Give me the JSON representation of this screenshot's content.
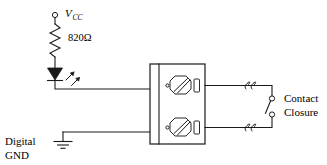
{
  "diagram": {
    "background_color": "#ffffff",
    "line_color": "#1a1a1a",
    "labels": {
      "vcc_main": "V",
      "vcc_subscript": "CC",
      "resistor_value": "820Ω",
      "ground_line1": "Digital",
      "ground_line2": "GND",
      "contact_line1": "Contact",
      "contact_line2": "Closure"
    },
    "components": [
      {
        "name": "vcc-terminal",
        "type": "open-terminal",
        "label": "V_CC"
      },
      {
        "name": "resistor",
        "type": "zigzag-resistor",
        "value": "820Ω"
      },
      {
        "name": "led",
        "type": "light-emitting-diode",
        "orientation": "cathode-down",
        "emission_arrows": 2
      },
      {
        "name": "ground",
        "type": "earth-ground",
        "label": "Digital GND",
        "bars": 3
      },
      {
        "name": "terminal-block",
        "type": "two-position-screw-terminal-block",
        "screws": 2,
        "clamps": 2
      },
      {
        "name": "contact-closure-switch",
        "type": "spst-switch",
        "state": "open",
        "label": "Contact Closure"
      },
      {
        "name": "wire-break-upper",
        "type": "wire-break-squiggle"
      },
      {
        "name": "wire-break-lower",
        "type": "wire-break-squiggle"
      }
    ]
  }
}
